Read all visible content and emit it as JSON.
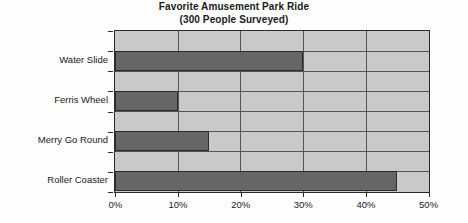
{
  "chart_data": {
    "type": "bar",
    "orientation": "horizontal",
    "title": "Favorite Amusement Park Ride",
    "subtitle": "(300 People Surveyed)",
    "categories": [
      "Water Slide",
      "Ferris Wheel",
      "Merry Go Round",
      "Roller Coaster"
    ],
    "values": [
      30,
      10,
      15,
      45
    ],
    "value_unit": "%",
    "xlabel": "",
    "ylabel": "",
    "xlim": [
      0,
      50
    ],
    "xticks": [
      0,
      10,
      20,
      30,
      40,
      50
    ],
    "xtick_labels": [
      "0%",
      "10%",
      "20%",
      "30%",
      "40%",
      "50%"
    ],
    "grid": true,
    "legend": false,
    "colors": {
      "bar_fill": "#666666",
      "bar_border": "#2b2b2b",
      "plot_background": "#c9c9c9",
      "grid_line": "#555555",
      "axis": "#2b2b2b",
      "text": "#1a1a1a",
      "page_background": "#fdfdfd"
    }
  }
}
